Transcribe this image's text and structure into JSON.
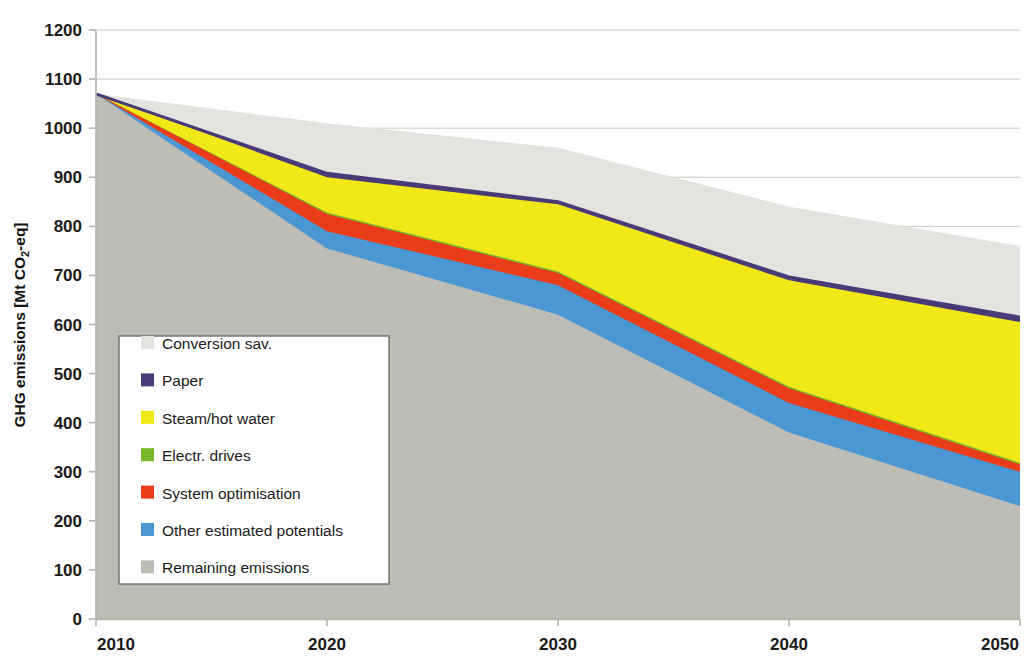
{
  "chart_data": {
    "type": "area",
    "title": "",
    "subtitle": "",
    "xlabel": "",
    "ylabel": "GHG emissions [Mt CO2-eq]",
    "ylabel_parts": {
      "pre": "GHG emissions [Mt CO",
      "sub": "2",
      "post": "-eq]"
    },
    "x": [
      2010,
      2020,
      2030,
      2040,
      2050
    ],
    "xtick_labels": [
      "2010",
      "2020",
      "2030",
      "2040",
      "2050"
    ],
    "xlim": [
      2010,
      2050
    ],
    "ylim": [
      0,
      1200
    ],
    "ytick_labels": [
      "0",
      "100",
      "200",
      "300",
      "400",
      "500",
      "600",
      "700",
      "800",
      "900",
      "1000",
      "1100",
      "1200"
    ],
    "yticks": [
      0,
      100,
      200,
      300,
      400,
      500,
      600,
      700,
      800,
      900,
      1000,
      1100,
      1200
    ],
    "grid": true,
    "grid_axis": "y",
    "stacked": true,
    "stack_order_bottom_to_top": [
      "Remaining emissions",
      "Other estimated potentials",
      "System optimisation",
      "Electr. drives",
      "Steam/hot water",
      "Paper",
      "Conversion sav."
    ],
    "legend_position": "inside-left",
    "series": [
      {
        "name": "Remaining emissions",
        "color": "#bdbdb6",
        "values": [
          1070,
          755,
          620,
          380,
          230
        ]
      },
      {
        "name": "Other estimated potentials",
        "color": "#4a97d4",
        "values": [
          0,
          35,
          60,
          60,
          70
        ]
      },
      {
        "name": "System optimisation",
        "color": "#ea3c19",
        "values": [
          0,
          35,
          25,
          30,
          15
        ]
      },
      {
        "name": "Electr. drives",
        "color": "#76b82a",
        "values": [
          0,
          3,
          3,
          3,
          3
        ]
      },
      {
        "name": "Steam/hot water",
        "color": "#f2e818",
        "values": [
          0,
          72,
          137,
          217,
          287
        ]
      },
      {
        "name": "Paper",
        "color": "#4a3b78",
        "values": [
          0,
          8,
          5,
          7,
          10
        ]
      },
      {
        "name": "Conversion sav.",
        "color": "#e3e3e0",
        "values": [
          0,
          102,
          110,
          143,
          145
        ]
      }
    ],
    "cumulative_tops": {
      "remaining": [
        1070,
        755,
        620,
        380,
        230
      ],
      "other": [
        1070,
        790,
        680,
        440,
        300
      ],
      "system": [
        1070,
        825,
        705,
        470,
        315
      ],
      "drives": [
        1070,
        828,
        708,
        473,
        318
      ],
      "steam": [
        1070,
        900,
        845,
        690,
        605
      ],
      "paper": [
        1070,
        908,
        850,
        697,
        615
      ],
      "conversion": [
        1070,
        1010,
        960,
        840,
        760
      ]
    }
  },
  "legend": {
    "items": [
      {
        "label": "Conversion sav.",
        "color": "#e3e3e0"
      },
      {
        "label": "Paper",
        "color": "#4a3b78"
      },
      {
        "label": "Steam/hot water",
        "color": "#f2e818"
      },
      {
        "label": "Electr. drives",
        "color": "#76b82a"
      },
      {
        "label": "System optimisation",
        "color": "#ea3c19"
      },
      {
        "label": "Other estimated potentials",
        "color": "#4a97d4"
      },
      {
        "label": "Remaining emissions",
        "color": "#bdbdb6"
      }
    ]
  },
  "colors": {
    "conversion_savings": "#e3e3e0",
    "paper": "#4a3b78",
    "steam_hot_water": "#f2e818",
    "electr_drives": "#76b82a",
    "system_optimisation": "#ea3c19",
    "other_estimated_potentials": "#4a97d4",
    "remaining_emissions": "#bdbdb6",
    "gridline": "#c9c9c4",
    "axis": "#b5b5ae",
    "text": "#1a1a1a",
    "plot_background": "#ffffff",
    "legend_background": "#ffffff",
    "legend_border": "#6e6e68"
  }
}
